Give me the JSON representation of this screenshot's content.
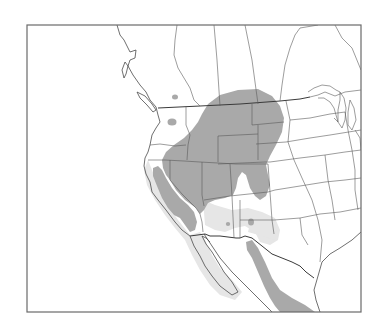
{
  "map": {
    "type": "range-map",
    "region": "Western North America",
    "legend": [],
    "colors": {
      "background": "#ffffff",
      "frame": "#6a6a6a",
      "borders": "#555555",
      "range_primary": "#a9a9a9",
      "range_secondary": "#e6e6e6"
    },
    "layers": [
      {
        "name": "primary-range",
        "description": "Dark gray main distribution across Great Basin, Rockies and northern Plains, California Central Valley, and western Mexico (Sierra Madre)"
      },
      {
        "name": "secondary-range",
        "description": "Light gray halo of marginal occurrence around primary range, including Baja California, southern Arizona/New Mexico"
      },
      {
        "name": "isolated-patches",
        "description": "Small dark patches in southern British Columbia, eastern Washington, central Arizona and southern New Mexico"
      }
    ]
  }
}
